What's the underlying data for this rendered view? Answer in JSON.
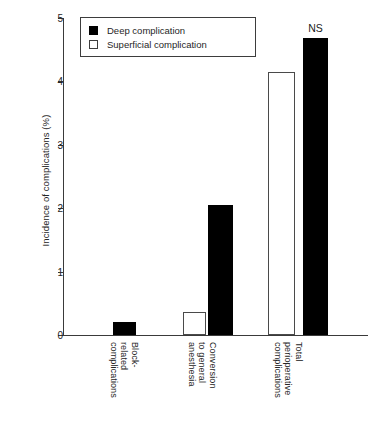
{
  "chart_data": {
    "type": "bar",
    "title": "",
    "xlabel": "",
    "ylabel": "Incidence of complications (%)",
    "ylim": [
      0,
      5
    ],
    "yticks": [
      "0",
      "1",
      "2",
      "3",
      "4",
      "5"
    ],
    "grid": false,
    "legend_position": "top-left",
    "categories": [
      "Block-\nrelated\ncomplications",
      "Conversion\nto general\nanesthesia",
      "Total\nperioperative\ncomplications"
    ],
    "series": [
      {
        "name": "Superficial complication",
        "color": "#ffffff",
        "values": [
          null,
          0.37,
          4.15
        ]
      },
      {
        "name": "Deep complication",
        "color": "#000000",
        "values": [
          0.21,
          2.05,
          4.68
        ]
      }
    ],
    "annotations": [
      {
        "text": "NS",
        "category": "Total\nperioperative\ncomplications",
        "series": "Deep complication",
        "value": 4.68
      }
    ]
  },
  "legend": {
    "items": [
      {
        "label": "Deep complication",
        "swatch": "filled-black-square"
      },
      {
        "label": "Superficial complication",
        "swatch": "open-white-square"
      }
    ]
  },
  "colors": {
    "deep": "#000000",
    "superficial": "#ffffff",
    "axis": "#3a3a3a",
    "text": "#262626",
    "background": "#ffffff"
  }
}
